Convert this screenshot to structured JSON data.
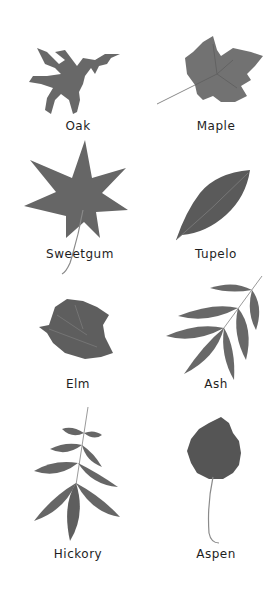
{
  "colors": {
    "leaf": "#6a6a6a",
    "leaf_dark": "#545454",
    "stem": "#8a8a8a",
    "label": "#1e1e1e",
    "background": "#ffffff"
  },
  "leaves": [
    {
      "name": "Oak",
      "label": "Oak",
      "icon": "oak-leaf-icon"
    },
    {
      "name": "Maple",
      "label": "Maple",
      "icon": "maple-leaf-icon"
    },
    {
      "name": "Sweetgum",
      "label": "Sweetgum",
      "icon": "sweetgum-leaf-icon"
    },
    {
      "name": "Tupelo",
      "label": "Tupelo",
      "icon": "tupelo-leaf-icon"
    },
    {
      "name": "Elm",
      "label": "Elm",
      "icon": "elm-leaf-icon"
    },
    {
      "name": "Ash",
      "label": "Ash",
      "icon": "ash-leaf-icon"
    },
    {
      "name": "Hickory",
      "label": "Hickory",
      "icon": "hickory-leaf-icon"
    },
    {
      "name": "Aspen",
      "label": "Aspen",
      "icon": "aspen-leaf-icon"
    }
  ]
}
